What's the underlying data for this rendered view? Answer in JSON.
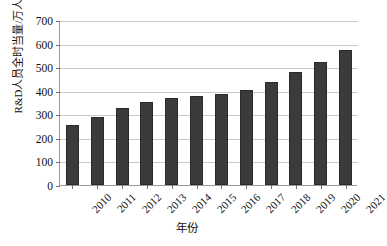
{
  "chart_data": {
    "type": "bar",
    "title": "",
    "xlabel": "年份",
    "ylabel": "R&D人员全时当量/万人",
    "categories": [
      "2010",
      "2011",
      "2012",
      "2013",
      "2014",
      "2015",
      "2016",
      "2017",
      "2018",
      "2019",
      "2020",
      "2021"
    ],
    "values": [
      255,
      289,
      325,
      353,
      371,
      376,
      388,
      403,
      438,
      481,
      523,
      572
    ],
    "ylim": [
      0,
      700
    ],
    "yticks": [
      0,
      100,
      200,
      300,
      400,
      500,
      600,
      700
    ],
    "ytick_labels": [
      "0",
      "100",
      "200",
      "300",
      "400",
      "500",
      "600",
      "700"
    ],
    "grid": true,
    "legend": false,
    "bar_color": "#3b3b3b",
    "grid_color": "#c9c9c9",
    "axis_color": "#9a9a9a"
  },
  "axes": {
    "y_title": "R&D人员全时当量/万人",
    "x_title": "年份"
  }
}
